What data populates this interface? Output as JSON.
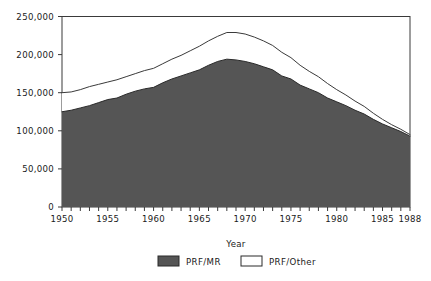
{
  "chart_data": {
    "type": "area",
    "stacked": true,
    "title": "",
    "subtitle": "",
    "xlabel": "Year",
    "ylabel": "",
    "xlim": [
      1950,
      1988
    ],
    "ylim": [
      0,
      250000
    ],
    "grid": false,
    "legend_position": "bottom",
    "x_tick_labels": [
      "1950",
      "1955",
      "1960",
      "1965",
      "1970",
      "1975",
      "1980",
      "1985",
      "1988"
    ],
    "x_tick_values": [
      1950,
      1955,
      1960,
      1965,
      1970,
      1975,
      1980,
      1985,
      1988
    ],
    "x_minor_tick_step": 1,
    "y_tick_labels": [
      "0",
      "50,000",
      "100,000",
      "150,000",
      "200,000",
      "250,000"
    ],
    "y_tick_values": [
      0,
      50000,
      100000,
      150000,
      200000,
      250000
    ],
    "x": [
      1950,
      1951,
      1952,
      1953,
      1954,
      1955,
      1956,
      1957,
      1958,
      1959,
      1960,
      1961,
      1962,
      1963,
      1964,
      1965,
      1966,
      1967,
      1968,
      1969,
      1970,
      1971,
      1972,
      1973,
      1974,
      1975,
      1976,
      1977,
      1978,
      1979,
      1980,
      1981,
      1982,
      1983,
      1984,
      1985,
      1986,
      1987,
      1988
    ],
    "series": [
      {
        "name": "PRF/MR",
        "color": "#555555",
        "values": [
          125000,
          127000,
          130000,
          133000,
          137000,
          141000,
          143000,
          148000,
          152000,
          155000,
          157000,
          163000,
          168000,
          172000,
          176000,
          180000,
          186000,
          191000,
          194000,
          193000,
          191000,
          188000,
          184000,
          180000,
          172000,
          168000,
          160000,
          155000,
          150000,
          143000,
          138000,
          133000,
          127000,
          122000,
          115000,
          109000,
          104000,
          99000,
          93000
        ]
      },
      {
        "name": "PRF/Other",
        "color": "#ffffff",
        "values": [
          25000,
          24000,
          24000,
          25000,
          24000,
          23000,
          24000,
          23000,
          23000,
          24000,
          25000,
          25000,
          26000,
          27000,
          29000,
          31000,
          32000,
          33000,
          35000,
          36000,
          36000,
          35000,
          34000,
          32000,
          31000,
          28000,
          26000,
          23000,
          21000,
          19000,
          16000,
          14000,
          12000,
          10000,
          8000,
          6000,
          4000,
          3000,
          2000
        ]
      }
    ],
    "totals": [
      150000,
      151000,
      154000,
      158000,
      161000,
      164000,
      167000,
      171000,
      175000,
      179000,
      182000,
      188000,
      194000,
      199000,
      205000,
      211000,
      218000,
      224000,
      229000,
      229000,
      227000,
      223000,
      218000,
      212000,
      203000,
      196000,
      186000,
      178000,
      171000,
      162000,
      154000,
      147000,
      139000,
      132000,
      123000,
      115000,
      108000,
      102000,
      95000
    ]
  },
  "legend": {
    "entries": [
      {
        "label": "PRF/MR",
        "swatch": "filled-dark"
      },
      {
        "label": "PRF/Other",
        "swatch": "outline-white"
      }
    ]
  },
  "colors": {
    "area_fill": "#555555",
    "area_line": "#222222",
    "axis": "#3a3a3a",
    "background": "#ffffff"
  }
}
